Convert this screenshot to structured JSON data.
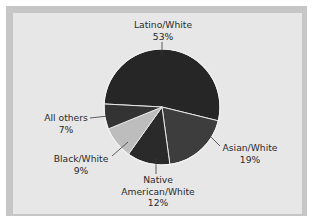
{
  "chart_data": {
    "type": "pie",
    "title": "",
    "categories": [
      "Latino/White",
      "Asian/White",
      "Native American/White",
      "Black/White",
      "All others"
    ],
    "values": [
      53,
      19,
      12,
      9,
      7
    ],
    "unit": "%",
    "colors": [
      "#262626",
      "#3d3d3d",
      "#2a2a2a",
      "#bdbdbd",
      "#333333"
    ],
    "legend": "none (direct labels with leader lines)"
  },
  "labels": {
    "latino_white": {
      "name": "Latino/White",
      "value": "53%"
    },
    "asian_white": {
      "name": "Asian/White",
      "value": "19%"
    },
    "native_american_white": {
      "name1": "Native",
      "name2": "American/White",
      "value": "12%"
    },
    "black_white": {
      "name": "Black/White",
      "value": "9%"
    },
    "all_others": {
      "name": "All others",
      "value": "7%"
    }
  }
}
